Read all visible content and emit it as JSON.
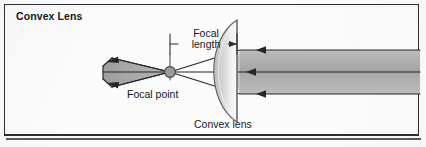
{
  "figure": {
    "title": "Convex Lens",
    "background_color": "#fbfbfb",
    "frame_color": "#2b2f33",
    "ink_color": "#15181b"
  },
  "labels": {
    "focal_length": "Focal\nlength",
    "focal_length_line1": "Focal",
    "focal_length_line2": "length",
    "focal_point": "Focal point",
    "convex_lens": "Convex lens"
  },
  "diagram": {
    "type": "optics-ray-diagram",
    "lens_type": "plano-convex",
    "lens": {
      "flat_side": "right",
      "curved_side": "left",
      "x_flat": 237,
      "x_apex": 214,
      "y_top": 20,
      "y_bottom": 122,
      "fill_light": "#f4f4f4",
      "fill_dark": "#b9b9b9",
      "edge_color": "#55585b"
    },
    "optical_axis_y": 72,
    "focal_point": {
      "x": 170,
      "y": 72,
      "radius": 5.5,
      "fill": "#9a9a9a",
      "edge": "#3c3f42"
    },
    "focal_length_dimension": {
      "x_start": 170,
      "x_end": 237,
      "y": 44,
      "tick_color": "#2b2f33"
    },
    "beam": {
      "direction": "right-to-left",
      "fill_top": "#b4b4b4",
      "fill_bottom": "#a0a0a0",
      "ray_color": "#22262a",
      "incoming_right_edge_x": 420,
      "incoming_half_width": 22,
      "rays": [
        {
          "name": "upper-ray",
          "y_in": 50,
          "arrow_x": 258
        },
        {
          "name": "axis-ray",
          "y_in": 72,
          "arrow_x": 248
        },
        {
          "name": "lower-ray",
          "y_in": 94,
          "arrow_x": 258
        }
      ],
      "converged_wedge": {
        "apex_x": 170,
        "tip_x": 103,
        "tip_top_y": 60,
        "tip_bottom_y": 85
      }
    }
  }
}
